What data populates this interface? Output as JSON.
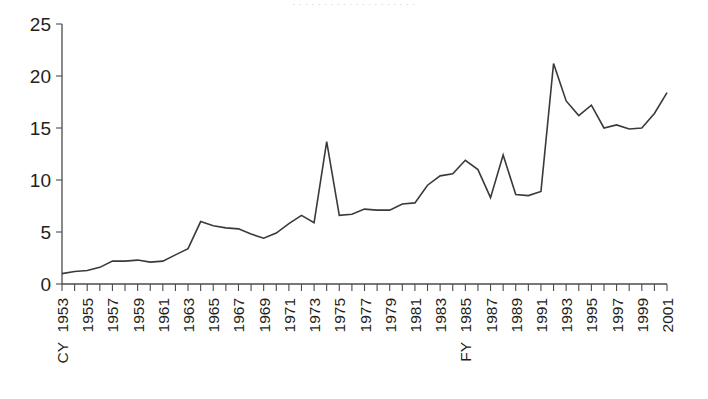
{
  "figure": {
    "title_faint": "· · · · · · · · · · · · · · · · · · · ·",
    "background_color": "#ffffff",
    "line_color": "#3a3a3a",
    "axis_color": "#4b4b4b",
    "text_color": "#231f20"
  },
  "chart_data": {
    "type": "line",
    "title": "",
    "xlabel": "",
    "ylabel": "",
    "ylim": [
      0,
      25
    ],
    "yticks": [
      0,
      5,
      10,
      15,
      20,
      25
    ],
    "ytick_labels": [
      "0",
      "5",
      "10",
      "15",
      "20",
      "25"
    ],
    "grid": false,
    "legend": "none",
    "x_axis_note_start": "CY",
    "x_axis_note_mid": "FY",
    "x_axis_note_mid_year": "1985",
    "xtick_labels": [
      "CY 1953",
      "1955",
      "1957",
      "1959",
      "1961",
      "1963",
      "1965",
      "1967",
      "1969",
      "1971",
      "1973",
      "1975",
      "1977",
      "1979",
      "1981",
      "1983",
      "FY 1985",
      "1987",
      "1989",
      "1991",
      "1993",
      "1995",
      "1997",
      "1999",
      "2001"
    ],
    "x": [
      1953,
      1954,
      1955,
      1956,
      1957,
      1958,
      1959,
      1960,
      1961,
      1962,
      1963,
      1964,
      1965,
      1966,
      1967,
      1968,
      1969,
      1970,
      1971,
      1972,
      1973,
      1974,
      1975,
      1976,
      1977,
      1978,
      1979,
      1980,
      1981,
      1982,
      1983,
      1984,
      1985,
      1986,
      1987,
      1988,
      1989,
      1990,
      1991,
      1992,
      1993,
      1994,
      1995,
      1996,
      1997,
      1998,
      1999,
      2000,
      2001
    ],
    "values": [
      1.0,
      1.2,
      1.3,
      1.6,
      2.2,
      2.2,
      2.3,
      2.1,
      2.2,
      2.8,
      3.4,
      6.0,
      5.6,
      5.4,
      5.3,
      4.8,
      4.4,
      4.9,
      5.8,
      6.6,
      5.9,
      13.7,
      6.6,
      6.7,
      7.2,
      7.1,
      7.1,
      7.7,
      7.8,
      9.5,
      10.4,
      10.6,
      11.9,
      11.0,
      8.3,
      12.4,
      8.6,
      8.5,
      8.9,
      21.2,
      17.6,
      16.2,
      17.2,
      15.0,
      15.3,
      14.9,
      15.0,
      16.4,
      18.4
    ],
    "series_name": "value"
  }
}
